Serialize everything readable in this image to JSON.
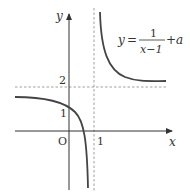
{
  "figure": {
    "type": "function graph",
    "function_label": {
      "lhs": "y",
      "eq": "=",
      "numerator": "1",
      "denominator": "x−1",
      "tail": "+a"
    },
    "axes": {
      "x_label": "x",
      "y_label": "y",
      "origin_label": "O"
    },
    "tick_labels": {
      "y_two": "2",
      "y_one": "1",
      "x_one": "1"
    },
    "asymptotes": {
      "vertical": "x = 1",
      "horizontal": "y = 2"
    },
    "colors": {
      "axis": "#333333",
      "curve": "#444444",
      "dashed": "#888888",
      "text": "#333333"
    }
  }
}
